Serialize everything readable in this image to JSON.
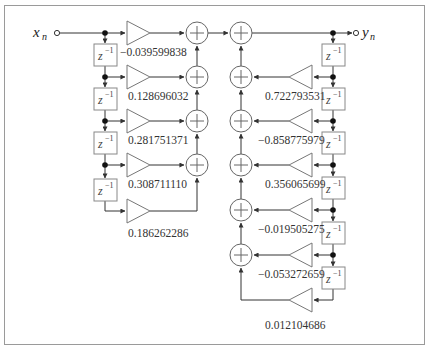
{
  "diagram": {
    "type": "IIR filter direct form I block diagram",
    "input_label": "x",
    "input_subscript": "n",
    "output_label": "y",
    "output_subscript": "n",
    "delay_label": "z",
    "delay_exponent": "−1",
    "feedforward_coefficients": [
      "−0.039599838",
      "0.128696032",
      "0.281751371",
      "0.308711110",
      "0.186262286"
    ],
    "feedback_coefficients": [
      "0.722793531",
      "−0.858775979",
      "0.356065699",
      "−0.019505275",
      "−0.053272659",
      "0.012104686"
    ],
    "colors": {
      "line": "#333333",
      "block_border": "#888888",
      "frame": "#9a9a9a",
      "background": "#ffffff"
    }
  }
}
